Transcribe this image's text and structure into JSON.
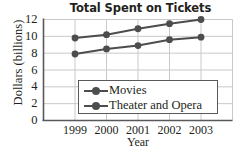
{
  "chart_data": {
    "type": "line",
    "title": "Total Spent on Tickets",
    "xlabel": "Year",
    "ylabel": "Dollars (billions)",
    "categories": [
      "1999",
      "2000",
      "2001",
      "2002",
      "2003"
    ],
    "series": [
      {
        "name": "Movies",
        "values": [
          7.9,
          8.5,
          8.9,
          9.6,
          9.9
        ],
        "color": "#4d4d4f",
        "marker": "circle"
      },
      {
        "name": "Theater and Opera",
        "values": [
          9.8,
          10.2,
          10.9,
          11.5,
          12.0
        ],
        "color": "#4d4d4f",
        "marker": "circle"
      }
    ],
    "ylim": [
      0,
      12
    ],
    "yticks": [
      "0",
      "2",
      "4",
      "6",
      "8",
      "10",
      "12"
    ],
    "grid": true,
    "legend_position": "inside-center"
  },
  "legend": {
    "entries": [
      {
        "label": "Movies",
        "icon": "line-marker-icon"
      },
      {
        "label": "Theater and Opera",
        "icon": "line-marker-icon"
      }
    ]
  },
  "colors": {
    "line": "#4d4d4f",
    "grid": "#c9c9c9",
    "axis": "#58595b",
    "text": "#231f20",
    "background": "#ffffff"
  }
}
